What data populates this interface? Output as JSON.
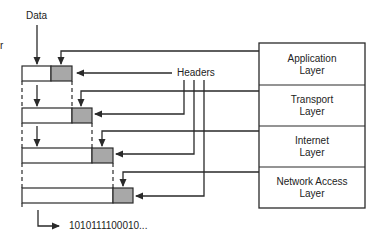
{
  "diagram": {
    "data_label": "Data",
    "headers_label": "Headers",
    "output_bits": "1010111100010...",
    "edge_fragment": "r",
    "layers": [
      {
        "line1": "Application",
        "line2": "Layer"
      },
      {
        "line1": "Transport",
        "line2": "Layer"
      },
      {
        "line1": "Internet",
        "line2": "Layer"
      },
      {
        "line1": "Network Access",
        "line2": "Layer"
      }
    ],
    "colors": {
      "line": "#2a2a2a",
      "header_fill": "#a8a8a8",
      "data_fill": "#ffffff"
    }
  }
}
